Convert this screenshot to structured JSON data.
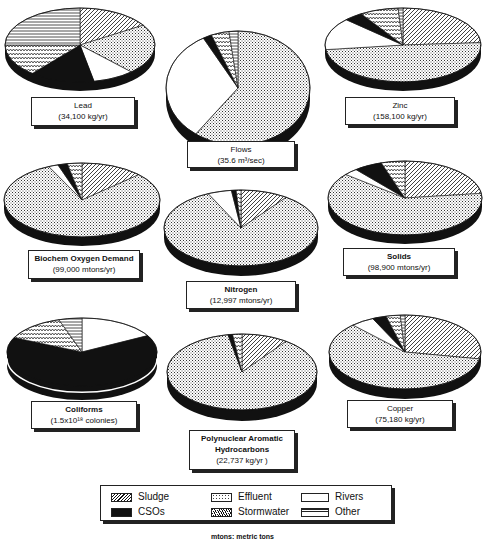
{
  "legend": {
    "items": [
      {
        "key": "sludge",
        "label": "Sludge",
        "pattern": "diagonal-hatch"
      },
      {
        "key": "effluent",
        "label": "Effluent",
        "pattern": "fine-dots"
      },
      {
        "key": "rivers",
        "label": "Rivers",
        "pattern": "white"
      },
      {
        "key": "csos",
        "label": "CSOs",
        "pattern": "solid-black"
      },
      {
        "key": "stormwater",
        "label": "Stormwater",
        "pattern": "wave-hatch"
      },
      {
        "key": "other",
        "label": "Other",
        "pattern": "horizontal-lines"
      }
    ]
  },
  "footnote": "mtons: metric tons",
  "chart_data": [
    {
      "type": "pie",
      "title": "Lead",
      "subtitle": "(34,100 kg/yr)",
      "categories": [
        "Sludge",
        "Effluent",
        "Rivers",
        "CSOs",
        "Stormwater",
        "Other"
      ],
      "values": [
        16,
        22,
        9,
        14,
        14,
        25
      ]
    },
    {
      "type": "pie",
      "title": "Flows",
      "subtitle": "(35.6 m³/sec)",
      "categories": [
        "Sludge",
        "Effluent",
        "Rivers",
        "CSOs",
        "Stormwater",
        "Other"
      ],
      "values": [
        0,
        60,
        32,
        2,
        4,
        2
      ]
    },
    {
      "type": "pie",
      "title": "Zinc",
      "subtitle": "(158,100 kg/yr)",
      "categories": [
        "Sludge",
        "Effluent",
        "Rivers",
        "CSOs",
        "Stormwater",
        "Other"
      ],
      "values": [
        24,
        49,
        14,
        4,
        8,
        1
      ]
    },
    {
      "type": "pie",
      "title": "Biochem Oxygen Demand",
      "subtitle": "(99,000 mtons/yr)",
      "categories": [
        "Sludge",
        "Effluent",
        "Rivers",
        "CSOs",
        "Stormwater",
        "Other"
      ],
      "values": [
        13,
        80,
        2,
        2,
        3,
        0
      ]
    },
    {
      "type": "pie",
      "title": "Nitrogen",
      "subtitle": "(12,997 mtons/yr)",
      "categories": [
        "Sludge",
        "Effluent",
        "Rivers",
        "CSOs",
        "Stormwater",
        "Other"
      ],
      "values": [
        10,
        83,
        5,
        1,
        1,
        0
      ]
    },
    {
      "type": "pie",
      "title": "Solids",
      "subtitle": "(98,900 mtons/yr)",
      "categories": [
        "Sludge",
        "Effluent",
        "Rivers",
        "CSOs",
        "Stormwater",
        "Other"
      ],
      "values": [
        23,
        63,
        3,
        6,
        5,
        0
      ]
    },
    {
      "type": "pie",
      "title": "Coliforms",
      "subtitle": "(1.5x10¹⁸ colonies)",
      "categories": [
        "Sludge",
        "Effluent",
        "Rivers",
        "CSOs",
        "Stormwater",
        "Other"
      ],
      "values": [
        0,
        0,
        17,
        65,
        13,
        5
      ]
    },
    {
      "type": "pie",
      "title": "Polynuclear Aromatic Hydrocarbons",
      "subtitle": "(22,737 kg/yr )",
      "categories": [
        "Sludge",
        "Effluent",
        "Rivers",
        "CSOs",
        "Stormwater",
        "Other"
      ],
      "values": [
        10,
        87,
        0,
        1,
        2,
        0
      ]
    },
    {
      "type": "pie",
      "title": "Copper",
      "subtitle": "(75,180 kg/yr)",
      "categories": [
        "Sludge",
        "Effluent",
        "Rivers",
        "CSOs",
        "Stormwater",
        "Other"
      ],
      "values": [
        28,
        60,
        5,
        3,
        3,
        1
      ]
    }
  ],
  "labels": [
    {
      "name": "Lead",
      "value": "(34,100 kg/yr)"
    },
    {
      "name": "Flows",
      "value": "(35.6 m³/sec)"
    },
    {
      "name": "Zinc",
      "value": "(158,100 kg/yr)"
    },
    {
      "name": "Biochem Oxygen Demand",
      "value": "(99,000 mtons/yr)"
    },
    {
      "name": "Nitrogen",
      "value": "(12,997 mtons/yr)"
    },
    {
      "name": "Solids",
      "value": "(98,900 mtons/yr)"
    },
    {
      "name": "Coliforms",
      "value": "(1.5x10¹⁸ colonies)"
    },
    {
      "name": "Polynuclear Aromatic",
      "name2": "Hydrocarbons",
      "value": "(22,737 kg/yr )"
    },
    {
      "name": "Copper",
      "value": "(75,180 kg/yr)"
    }
  ]
}
